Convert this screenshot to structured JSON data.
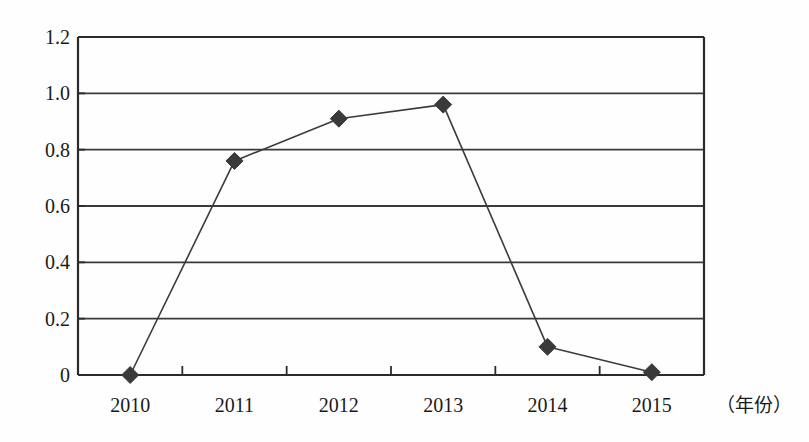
{
  "chart_data": {
    "type": "line",
    "title": "",
    "subtitle": "",
    "xlabel": "（年份）",
    "ylabel": "",
    "categories": [
      "2010",
      "2011",
      "2012",
      "2013",
      "2014",
      "2015"
    ],
    "values": [
      0.0,
      0.76,
      0.91,
      0.96,
      0.1,
      0.01
    ],
    "series": [
      {
        "name": "",
        "values": [
          0.0,
          0.76,
          0.91,
          0.96,
          0.1,
          0.01
        ]
      }
    ],
    "ylim": [
      0,
      1.2
    ],
    "y_ticks": [
      "0",
      "0.2",
      "0.4",
      "0.6",
      "0.8",
      "1.0",
      "1.2"
    ],
    "y_tick_values": [
      0,
      0.2,
      0.4,
      0.6,
      0.8,
      1.0,
      1.2
    ],
    "x_ticks": [
      "2010",
      "2011",
      "2012",
      "2013",
      "2014",
      "2015"
    ],
    "grid": "horizontal",
    "legend": "none",
    "marker": "diamond",
    "colors": {
      "line": "#3c3c3c",
      "marker": "#3a3a3a",
      "axis": "#2b2b2b",
      "grid": "#3a3a3a",
      "background": "#fefefe",
      "text": "#1a1a1a"
    }
  },
  "axis": {
    "y_labels": [
      "1.2",
      "1.0",
      "0.8",
      "0.6",
      "0.4",
      "0.2",
      "0"
    ],
    "x_labels": [
      "2010",
      "2011",
      "2012",
      "2013",
      "2014",
      "2015"
    ],
    "x_caption": "（年份）"
  }
}
